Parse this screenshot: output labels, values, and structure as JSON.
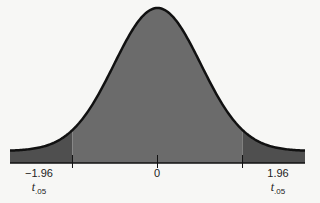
{
  "chart_data": {
    "type": "area",
    "title": "",
    "xlabel": "",
    "ylabel": "",
    "x_ticks": [
      {
        "value": -1.96,
        "label": "−1.96",
        "sublabel": "t",
        "sublabel_subscript": ".05"
      },
      {
        "value": 0,
        "label": "0"
      },
      {
        "value": 1.96,
        "label": "1.96",
        "sublabel": "t",
        "sublabel_subscript": ".05"
      }
    ],
    "xlim": [
      -3.4,
      3.4
    ],
    "critical_values": [
      -1.96,
      1.96
    ],
    "shaded_regions": [
      {
        "from": -3.4,
        "to": -1.96,
        "shade": "dark"
      },
      {
        "from": -1.96,
        "to": 1.96,
        "shade": "medium"
      },
      {
        "from": 1.96,
        "to": 3.4,
        "shade": "dark"
      }
    ],
    "grid": false,
    "legend": null
  },
  "labels": {
    "left_value": "−1.96",
    "center_value": "0",
    "right_value": "1.96",
    "t_symbol": "t",
    "t_subscript": ".05"
  },
  "colors": {
    "body_fill": "#6b6b6b",
    "tail_fill": "#4f4f4f",
    "curve_stroke": "#111111",
    "background": "#f7f7f5"
  }
}
